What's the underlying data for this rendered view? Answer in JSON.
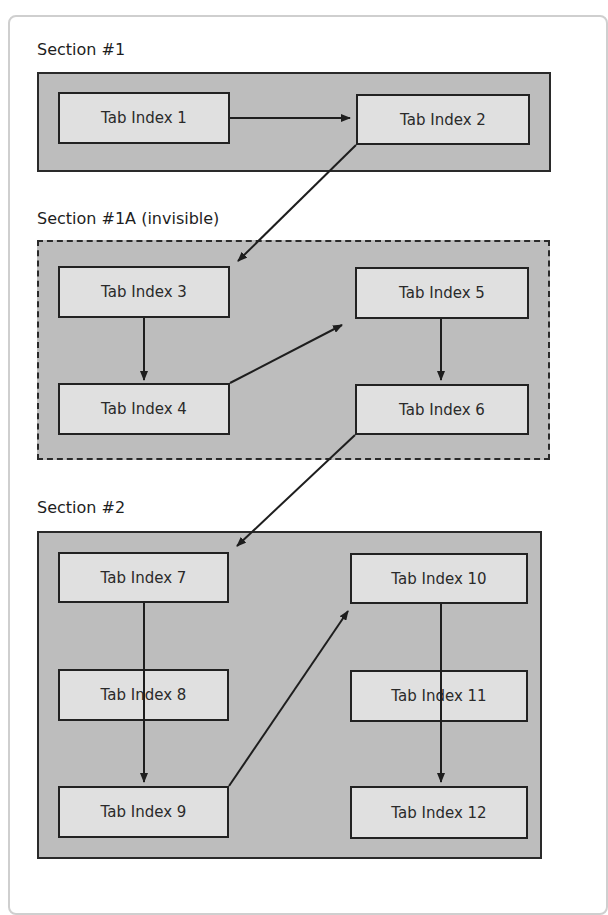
{
  "diagram": {
    "sections": [
      {
        "id": "section-1",
        "title": "Section #1",
        "style": "solid"
      },
      {
        "id": "section-1a",
        "title": "Section #1A (invisible)",
        "style": "dashed"
      },
      {
        "id": "section-2",
        "title": "Section #2",
        "style": "solid"
      }
    ],
    "tabs": [
      {
        "label": "Tab Index 1",
        "section": "Section #1"
      },
      {
        "label": "Tab Index 2",
        "section": "Section #1"
      },
      {
        "label": "Tab Index 3",
        "section": "Section #1A (invisible)"
      },
      {
        "label": "Tab Index 4",
        "section": "Section #1A (invisible)"
      },
      {
        "label": "Tab Index 5",
        "section": "Section #1A (invisible)"
      },
      {
        "label": "Tab Index 6",
        "section": "Section #1A (invisible)"
      },
      {
        "label": "Tab Index 7",
        "section": "Section #2"
      },
      {
        "label": "Tab Index 8",
        "section": "Section #2"
      },
      {
        "label": "Tab Index 9",
        "section": "Section #2"
      },
      {
        "label": "Tab Index 10",
        "section": "Section #2"
      },
      {
        "label": "Tab Index 11",
        "section": "Section #2"
      },
      {
        "label": "Tab Index 12",
        "section": "Section #2"
      }
    ],
    "flow": [
      [
        "Tab Index 1",
        "Tab Index 2"
      ],
      [
        "Tab Index 2",
        "Tab Index 3"
      ],
      [
        "Tab Index 3",
        "Tab Index 4"
      ],
      [
        "Tab Index 4",
        "Tab Index 5"
      ],
      [
        "Tab Index 5",
        "Tab Index 6"
      ],
      [
        "Tab Index 6",
        "Tab Index 7"
      ],
      [
        "Tab Index 7",
        "Tab Index 9"
      ],
      [
        "Tab Index 9",
        "Tab Index 10"
      ],
      [
        "Tab Index 10",
        "Tab Index 12"
      ]
    ],
    "colors": {
      "section_fill": "#bdbdbd",
      "tab_fill": "#e0e0e0",
      "border": "#222222",
      "frame_border": "#cfcfcf"
    }
  }
}
